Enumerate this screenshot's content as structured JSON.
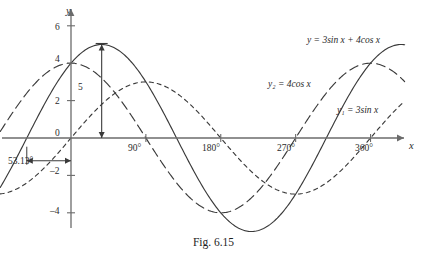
{
  "figure": {
    "caption": "Fig. 6.15",
    "background": "#ffffff",
    "ink": "#3a3a3a"
  },
  "axes": {
    "x_axis_label": "x",
    "y_axis_label": "y",
    "x_ticks": [
      {
        "label": "90°",
        "deg": 90
      },
      {
        "label": "180°",
        "deg": 180
      },
      {
        "label": "270°",
        "deg": 270
      },
      {
        "label": "360°",
        "deg": 360
      }
    ],
    "y_ticks": [
      {
        "label": "6",
        "value": 6
      },
      {
        "label": "4",
        "value": 4
      },
      {
        "label": "2",
        "value": 2
      },
      {
        "label": "0",
        "value": 0
      },
      {
        "label": "–2",
        "value": -2
      },
      {
        "label": "–4",
        "value": -4
      }
    ],
    "xlim": [
      -80,
      400
    ],
    "ylim": [
      -6,
      7
    ]
  },
  "annotations": {
    "phase_shift": "53.13°",
    "amplitude": "5"
  },
  "chart_data": {
    "type": "line",
    "title": "Fig. 6.15",
    "xlabel": "x",
    "ylabel": "y",
    "xlim": [
      -80,
      400
    ],
    "ylim": [
      -6,
      7
    ],
    "grid": false,
    "x_unit": "degrees",
    "legend": "inline-curve-labels",
    "annotations": [
      {
        "text": "53.13°",
        "meaning": "phase lead of resultant wave",
        "x_from": -53.13,
        "x_to": 0,
        "y": -1
      },
      {
        "text": "5",
        "meaning": "amplitude of resultant wave",
        "x": 36.87,
        "y_from": 0,
        "y_to": 5
      }
    ],
    "series": [
      {
        "name": "y = 3sin x + 4cos x",
        "label": "y = 3sin x + 4cos x",
        "style": "solid",
        "amplitude": 5,
        "phase_deg": 53.13,
        "form": "5 sin(x + 53.13°)",
        "x": [
          -80,
          -60,
          -53.13,
          -40,
          -20,
          0,
          20,
          36.87,
          60,
          90,
          120,
          150,
          180,
          210,
          240,
          270,
          300,
          330,
          360,
          390,
          400
        ],
        "y": [
          -2.42,
          -0.6,
          0,
          1.13,
          2.87,
          4.0,
          4.79,
          5.0,
          4.6,
          3.0,
          0.87,
          -1.46,
          -4.0,
          -5.0,
          -4.6,
          -3.0,
          -0.87,
          1.46,
          4.0,
          5.0,
          4.79
        ]
      },
      {
        "name": "y2 = 4cos x",
        "label": "y₂ = 4cos x",
        "style": "long-dash",
        "amplitude": 4,
        "phase_deg": 90,
        "x": [
          -80,
          -60,
          -30,
          0,
          30,
          60,
          90,
          120,
          150,
          180,
          210,
          240,
          270,
          300,
          330,
          360,
          390,
          400
        ],
        "y": [
          0.69,
          2.0,
          3.46,
          4.0,
          3.46,
          2.0,
          0.0,
          -2.0,
          -3.46,
          -4.0,
          -3.46,
          -2.0,
          0.0,
          2.0,
          3.46,
          4.0,
          3.46,
          3.06
        ]
      },
      {
        "name": "y1 = 3sin x",
        "label": "y₁ = 3sin x",
        "style": "short-dash",
        "amplitude": 3,
        "phase_deg": 0,
        "x": [
          -80,
          -60,
          -30,
          0,
          30,
          60,
          90,
          120,
          150,
          180,
          210,
          240,
          270,
          300,
          330,
          360,
          390,
          400
        ],
        "y": [
          -2.95,
          -2.6,
          -1.5,
          0.0,
          1.5,
          2.6,
          3.0,
          2.6,
          1.5,
          0.0,
          -1.5,
          -2.6,
          -3.0,
          -2.6,
          -1.5,
          0.0,
          1.5,
          1.93
        ]
      }
    ]
  }
}
